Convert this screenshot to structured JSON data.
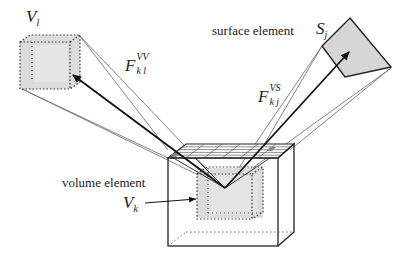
{
  "diagram": {
    "labels": {
      "volume_l": {
        "main": "V",
        "sub": "l"
      },
      "surface_element_text": "surface element",
      "surface_j": {
        "main": "S",
        "sub": "j"
      },
      "f_vv": {
        "main": "F",
        "sup": "VV",
        "sub": "k l"
      },
      "f_vs": {
        "main": "F",
        "sup": "VS",
        "sub": "k j"
      },
      "volume_element_text": "volume element",
      "volume_k": {
        "main": "V",
        "sub": "k"
      }
    },
    "colors": {
      "line": "#222222",
      "thin_line": "#555555",
      "fill_gray": "#dcdcdc",
      "dotted": "#333333"
    }
  }
}
